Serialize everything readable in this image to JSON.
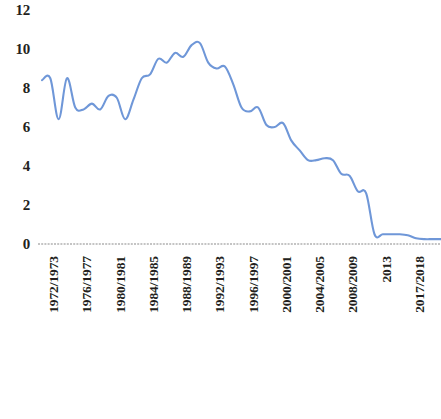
{
  "chart_data": {
    "type": "line",
    "title": "",
    "subtitle": "",
    "xlabel": "",
    "ylabel": "",
    "ylim": [
      0,
      12
    ],
    "yticks": [
      0,
      2,
      4,
      6,
      8,
      10,
      12
    ],
    "grid": false,
    "legend": null,
    "legend_position": "none",
    "line_color": "#6f97d8",
    "axis_color": "#8a8a8a",
    "text_color": "#231f20",
    "categories": [
      "1972/1973",
      "1973/1974",
      "1974/1975",
      "1975/1976",
      "1976/1977",
      "1977/1978",
      "1978/1979",
      "1979/1980",
      "1980/1981",
      "1981/1982",
      "1982/1983",
      "1983/1984",
      "1984/1985",
      "1985/1986",
      "1986/1987",
      "1987/1988",
      "1988/1989",
      "1989/1990",
      "1990/1991",
      "1991/1992",
      "1992/1993",
      "1993/1994",
      "1994/1995",
      "1995/1996",
      "1996/1997",
      "1997/1998",
      "1998/1999",
      "1999/2000",
      "2000/2001",
      "2001/2002",
      "2002/2003",
      "2003/2004",
      "2004/2005",
      "2005/2006",
      "2006/2007",
      "2007/2008",
      "2008/2009",
      "2009/2010",
      "2010/2011",
      "2011/2012",
      "2013",
      "2014",
      "2015",
      "2016",
      "2017/2018",
      "2018/2019",
      "2019/2020",
      "2020/2021",
      "EXERCICE 2021–22"
    ],
    "xtick_labels": [
      "1972/1973",
      "1976/1977",
      "1980/1981",
      "1984/1985",
      "1988/1989",
      "1992/1993",
      "1996/1997",
      "2000/2001",
      "2004/2005",
      "2008/2009",
      "2013",
      "2017/2018",
      "EXERCICE 2021–22"
    ],
    "values": [
      8.4,
      8.5,
      6.4,
      8.5,
      7.0,
      6.9,
      7.2,
      6.9,
      7.6,
      7.5,
      6.4,
      7.4,
      8.5,
      8.7,
      9.5,
      9.3,
      9.8,
      9.6,
      10.2,
      10.3,
      9.3,
      9.0,
      9.1,
      8.2,
      7.0,
      6.8,
      7.0,
      6.1,
      6.0,
      6.2,
      5.3,
      4.8,
      4.3,
      4.3,
      4.4,
      4.3,
      3.6,
      3.5,
      2.7,
      2.6,
      0.5,
      0.5,
      0.5,
      0.5,
      0.45,
      0.3,
      0.25,
      0.25,
      0.25
    ]
  },
  "axis": {
    "y_tick_labels": [
      "12",
      "10",
      "8",
      "6",
      "4",
      "2",
      "0"
    ]
  }
}
